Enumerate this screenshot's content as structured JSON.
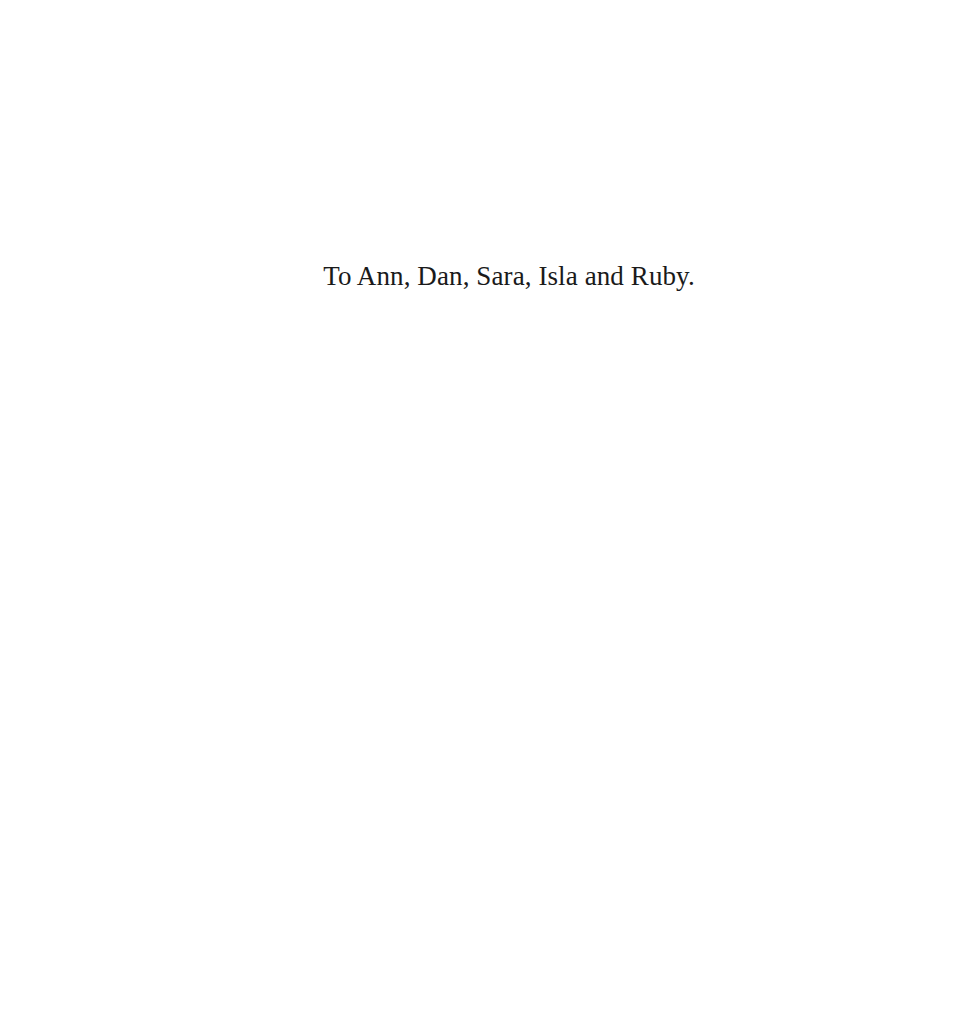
{
  "page": {
    "dedication": "To Ann, Dan, Sara, Isla and Ruby."
  }
}
